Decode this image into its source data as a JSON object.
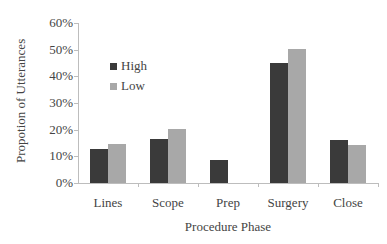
{
  "chart_data": {
    "type": "bar",
    "title": "",
    "xlabel": "Procedure Phase",
    "ylabel": "Propotion of Utterances",
    "categories": [
      "Lines",
      "Scope",
      "Prep",
      "Surgery",
      "Close"
    ],
    "series": [
      {
        "name": "High",
        "color": "#3a3a3a",
        "values": [
          12.7,
          16.5,
          8.6,
          45.0,
          16.1
        ]
      },
      {
        "name": "Low",
        "color": "#a8a8a8",
        "values": [
          14.6,
          20.2,
          0,
          50.3,
          14.2
        ]
      }
    ],
    "ylim": [
      0,
      60
    ],
    "yticks": [
      "0%",
      "10%",
      "20%",
      "30%",
      "40%",
      "50%",
      "60%"
    ],
    "grid": false,
    "legend_position": "upper-left inside"
  },
  "legend": {
    "items": [
      {
        "label": "High",
        "color": "#3a3a3a"
      },
      {
        "label": "Low",
        "color": "#a8a8a8"
      }
    ]
  },
  "axes": {
    "x_title": "Procedure Phase",
    "y_title": "Propotion of Utterances"
  }
}
